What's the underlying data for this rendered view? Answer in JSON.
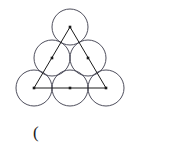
{
  "figure": {
    "canvas": {
      "width": 189,
      "height": 153,
      "background": "#ffffff"
    },
    "stroke_color": "#3a3a4a",
    "stroke_width": 0.9,
    "dot_color": "#1a1a1a",
    "dot_size": 2.6,
    "circle_radius": 18,
    "circles": [
      {
        "id": "circle-top",
        "label": "top circle",
        "cx": 70,
        "cy": 27
      },
      {
        "id": "circle-middle-left",
        "label": "middle left circle",
        "cx": 52,
        "cy": 58
      },
      {
        "id": "circle-middle-right",
        "label": "middle right circle",
        "cx": 88,
        "cy": 58
      },
      {
        "id": "circle-bottom-left",
        "label": "bottom left circle",
        "cx": 34,
        "cy": 88
      },
      {
        "id": "circle-bottom-mid",
        "label": "bottom middle circle",
        "cx": 70,
        "cy": 88
      },
      {
        "id": "circle-bottom-right",
        "label": "bottom right circle",
        "cx": 106,
        "cy": 88
      }
    ],
    "triangle": {
      "id": "inscribed-triangle",
      "label": "triangle joining outer circle centers",
      "points": "70,27 34,88 106,88"
    },
    "center_dots": [
      {
        "id": "dot-top",
        "cx": 70,
        "cy": 27
      },
      {
        "id": "dot-middle-left",
        "cx": 52,
        "cy": 58
      },
      {
        "id": "dot-middle-right",
        "cx": 88,
        "cy": 58
      },
      {
        "id": "dot-bottom-left",
        "cx": 34,
        "cy": 88
      },
      {
        "id": "dot-bottom-mid",
        "cx": 70,
        "cy": 88
      },
      {
        "id": "dot-bottom-right",
        "cx": 106,
        "cy": 88
      }
    ]
  },
  "caption": {
    "text": "("
  }
}
